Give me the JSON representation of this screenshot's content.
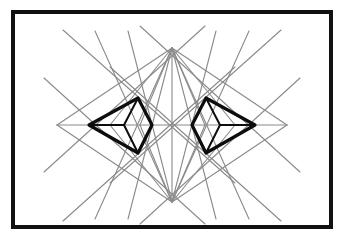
{
  "figure": {
    "canvas": {
      "width": 345,
      "height": 239,
      "background": "#ffffff"
    },
    "frame": {
      "name": "outer-black-border",
      "x": 13,
      "y": 12,
      "width": 318,
      "height": 215,
      "stroke": "#111111",
      "stroke_width": 4,
      "fill": "none"
    },
    "palette": {
      "background": "#ffffff",
      "frame": "#111111",
      "construction_line": "#8a8a8a",
      "bold_shape": "#0d0d0d"
    },
    "anchors": {
      "top_apex": {
        "x": 172,
        "y": 48
      },
      "bottom_apex": {
        "x": 172,
        "y": 202
      },
      "left_tip": {
        "x": 57,
        "y": 125
      },
      "right_tip": {
        "x": 287,
        "y": 125
      },
      "center": {
        "x": 172,
        "y": 125
      }
    },
    "construction_lines": {
      "name": "gray-construction-lines",
      "stroke": "#8a8a8a",
      "stroke_width": 1.1,
      "count": 30,
      "segments": [
        [
          172,
          48,
          172,
          202
        ],
        [
          57,
          125,
          287,
          125
        ],
        [
          172,
          48,
          57,
          125
        ],
        [
          172,
          48,
          287,
          125
        ],
        [
          172,
          202,
          57,
          125
        ],
        [
          172,
          202,
          287,
          125
        ],
        [
          172,
          48,
          110,
          125
        ],
        [
          172,
          48,
          140,
          125
        ],
        [
          172,
          48,
          205,
          125
        ],
        [
          172,
          48,
          235,
          125
        ],
        [
          172,
          202,
          110,
          125
        ],
        [
          172,
          202,
          140,
          125
        ],
        [
          172,
          202,
          205,
          125
        ],
        [
          172,
          202,
          235,
          125
        ],
        [
          172,
          48,
          128,
          219
        ],
        [
          172,
          48,
          216,
          219
        ],
        [
          172,
          202,
          128,
          31
        ],
        [
          172,
          202,
          216,
          31
        ],
        [
          172,
          48,
          95,
          219
        ],
        [
          172,
          48,
          249,
          219
        ],
        [
          172,
          202,
          95,
          31
        ],
        [
          172,
          202,
          249,
          31
        ],
        [
          63,
          30,
          235,
          183
        ],
        [
          281,
          30,
          110,
          183
        ],
        [
          63,
          221,
          235,
          67
        ],
        [
          281,
          221,
          110,
          67
        ],
        [
          44,
          78,
          205,
          224
        ],
        [
          300,
          78,
          140,
          224
        ],
        [
          44,
          172,
          205,
          26
        ],
        [
          300,
          172,
          140,
          26
        ]
      ]
    },
    "bold_shapes": [
      {
        "name": "left-bold-polygon",
        "stroke": "#0d0d0d",
        "stroke_width": 3.2,
        "fill": "none",
        "outer_points": "89,125 138,98 152,125 138,153",
        "inner_diamond": "138,98 152,125 138,153 124,125",
        "spoke": [
          89,
          125,
          124,
          125
        ]
      },
      {
        "name": "right-bold-polygon",
        "stroke": "#0d0d0d",
        "stroke_width": 3.2,
        "fill": "none",
        "outer_points": "255,125 206,98 192,125 206,153",
        "inner_diamond": "206,98 192,125 206,153 220,125",
        "spoke": [
          255,
          125,
          220,
          125
        ]
      }
    ]
  },
  "chart_data": {
    "type": "line",
    "xlabel": "",
    "ylabel": "",
    "xlim": [
      0,
      345
    ],
    "ylim": [
      0,
      239
    ],
    "grid": false,
    "legend": "none",
    "series": [
      {
        "name": "construction-web",
        "color": "#8a8a8a",
        "point_count": 60
      },
      {
        "name": "left-bold-polygon",
        "color": "#0d0d0d",
        "point_count": 8
      },
      {
        "name": "right-bold-polygon",
        "color": "#0d0d0d",
        "point_count": 8
      }
    ],
    "annotations": [
      "top apex",
      "bottom apex",
      "left tip",
      "right tip"
    ]
  }
}
